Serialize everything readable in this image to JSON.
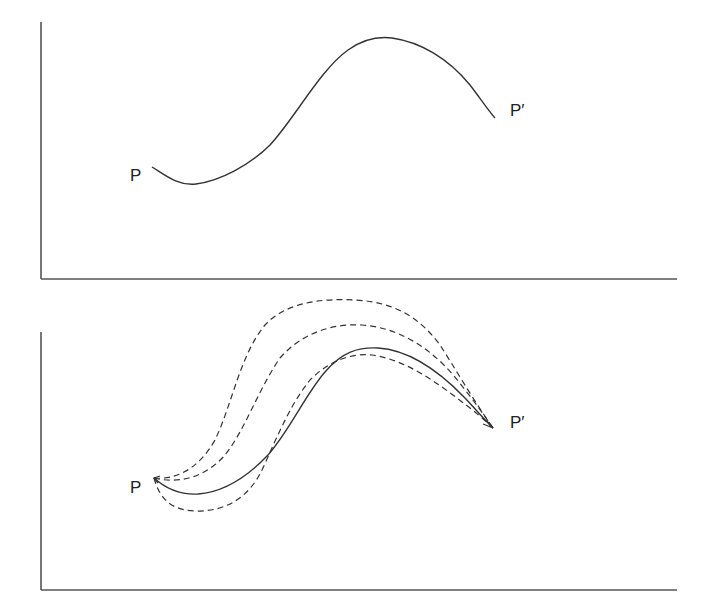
{
  "panels": [
    {
      "id": "top",
      "description": "Single path from P to P'",
      "labels": {
        "start": "P",
        "end": "P′"
      },
      "paths": [
        {
          "style": "solid",
          "role": "actual-path"
        }
      ]
    },
    {
      "id": "bottom",
      "description": "Actual path (solid) with three varied neighboring paths (dashed) from P to P'",
      "labels": {
        "start": "P",
        "end": "P′"
      },
      "paths": [
        {
          "style": "solid",
          "role": "actual-path"
        },
        {
          "style": "dashed",
          "role": "varied-path-upper-outer"
        },
        {
          "style": "dashed",
          "role": "varied-path-upper-inner"
        },
        {
          "style": "dashed",
          "role": "varied-path-lower"
        }
      ]
    }
  ],
  "colors": {
    "axis": "#555555",
    "curve": "#333333",
    "background": "#ffffff"
  }
}
